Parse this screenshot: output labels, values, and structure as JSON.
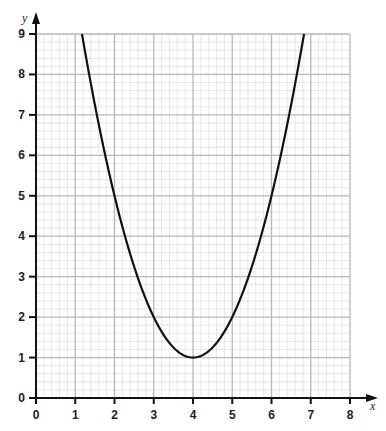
{
  "chart_data": {
    "type": "line",
    "title": "",
    "xlabel": "x",
    "ylabel": "y",
    "xlim": [
      0,
      8
    ],
    "ylim": [
      0,
      9
    ],
    "xticks": [
      0,
      1,
      2,
      3,
      4,
      5,
      6,
      7,
      8
    ],
    "yticks": [
      0,
      1,
      2,
      3,
      4,
      5,
      6,
      7,
      8,
      9
    ],
    "grid": true,
    "minor_grid_per_unit": 5,
    "legend": null,
    "series": [
      {
        "name": "y = x^2 - 8x + 17",
        "x": [
          1.17,
          1.5,
          2,
          2.5,
          3,
          3.5,
          4,
          4.5,
          5,
          5.5,
          6,
          6.5,
          6.83
        ],
        "y": [
          9.0,
          7.25,
          5.0,
          3.25,
          2.0,
          1.25,
          1.0,
          1.25,
          2.0,
          3.25,
          5.0,
          7.25,
          9.0
        ]
      }
    ],
    "annotations": [
      "minimum at (4, 1)"
    ]
  },
  "colors": {
    "curve": "#111111",
    "axis": "#111111",
    "major_grid": "#b8b8b8",
    "minor_grid": "#dcdcdc"
  }
}
